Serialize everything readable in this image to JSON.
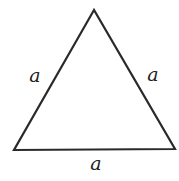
{
  "diagram": {
    "type": "equilateral-triangle",
    "colors": {
      "stroke": "#2a2a2a",
      "label": "#222222",
      "background": "#ffffff"
    },
    "vertices": {
      "top": [
        94,
        10
      ],
      "bottom_left": [
        14,
        150
      ],
      "bottom_right": [
        175,
        149
      ]
    },
    "labels": {
      "left_side": "a",
      "right_side": "a",
      "bottom_side": "a"
    }
  }
}
